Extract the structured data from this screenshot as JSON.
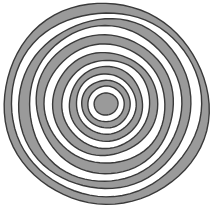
{
  "figure": {
    "name": "concentric-rings-target",
    "background_color": "#ffffff",
    "canvas": {
      "width": 212,
      "height": 213
    }
  },
  "chart_data": {
    "type": "pie",
    "subtitle": "",
    "xlabel": "",
    "ylabel": "",
    "legend": [],
    "annotations": [],
    "grid": false,
    "center": {
      "x": 106,
      "y": 104
    },
    "outer_radius": 102,
    "stroke_color": "#3a3a3a",
    "stroke_width": 1.4,
    "fill_gray": "#9a9a9a",
    "fill_white": "#ffffff",
    "ring_count": 13,
    "categories": [
      "ring-13-outer",
      "ring-12",
      "ring-11",
      "ring-10",
      "ring-9",
      "ring-8",
      "ring-7",
      "ring-6",
      "ring-5",
      "ring-4",
      "ring-3",
      "ring-2",
      "ring-1-core"
    ],
    "values": [
      102,
      94,
      86,
      77,
      69,
      60,
      52,
      44,
      37,
      30,
      24,
      18,
      12
    ],
    "series": [
      {
        "name": "radius",
        "values": [
          102,
          94,
          86,
          77,
          69,
          60,
          52,
          44,
          37,
          30,
          24,
          18,
          12
        ]
      },
      {
        "name": "fill",
        "values": [
          "#9a9a9a",
          "#ffffff",
          "#9a9a9a",
          "#ffffff",
          "#9a9a9a",
          "#ffffff",
          "#9a9a9a",
          "#ffffff",
          "#9a9a9a",
          "#ffffff",
          "#9a9a9a",
          "#ffffff",
          "#9a9a9a"
        ]
      }
    ],
    "rings": [
      {
        "index": 13,
        "label": "ring-13-outer",
        "radius": 102,
        "fill": "#9a9a9a",
        "cx": 106,
        "cy": 104,
        "rx": 102,
        "ry": 101
      },
      {
        "index": 12,
        "label": "ring-12",
        "radius": 94,
        "fill": "#ffffff",
        "cx": 106,
        "cy": 104,
        "rx": 94,
        "ry": 93
      },
      {
        "index": 11,
        "label": "ring-11",
        "radius": 86,
        "fill": "#9a9a9a",
        "cx": 105,
        "cy": 104,
        "rx": 86,
        "ry": 85
      },
      {
        "index": 10,
        "label": "ring-10",
        "radius": 77,
        "fill": "#ffffff",
        "cx": 105,
        "cy": 104,
        "rx": 77,
        "ry": 77
      },
      {
        "index": 9,
        "label": "ring-9",
        "radius": 69,
        "fill": "#9a9a9a",
        "cx": 105,
        "cy": 104,
        "rx": 69,
        "ry": 69
      },
      {
        "index": 8,
        "label": "ring-8",
        "radius": 60,
        "fill": "#ffffff",
        "cx": 105,
        "cy": 104,
        "rx": 60,
        "ry": 60
      },
      {
        "index": 7,
        "label": "ring-7",
        "radius": 52,
        "fill": "#9a9a9a",
        "cx": 105,
        "cy": 104,
        "rx": 52,
        "ry": 52
      },
      {
        "index": 6,
        "label": "ring-6",
        "radius": 44,
        "fill": "#ffffff",
        "cx": 106,
        "cy": 104,
        "rx": 44,
        "ry": 44
      },
      {
        "index": 5,
        "label": "ring-5",
        "radius": 37,
        "fill": "#9a9a9a",
        "cx": 106,
        "cy": 104,
        "rx": 37,
        "ry": 37
      },
      {
        "index": 4,
        "label": "ring-4",
        "radius": 30,
        "fill": "#ffffff",
        "cx": 106,
        "cy": 104,
        "rx": 30,
        "ry": 30
      },
      {
        "index": 3,
        "label": "ring-3",
        "radius": 24,
        "fill": "#9a9a9a",
        "cx": 106,
        "cy": 104,
        "rx": 24,
        "ry": 24
      },
      {
        "index": 2,
        "label": "ring-2",
        "radius": 18,
        "fill": "#ffffff",
        "cx": 106,
        "cy": 104,
        "rx": 18,
        "ry": 18
      },
      {
        "index": 1,
        "label": "ring-1-core",
        "radius": 12,
        "fill": "#9a9a9a",
        "cx": 106,
        "cy": 104,
        "rx": 12,
        "ry": 11
      }
    ]
  }
}
